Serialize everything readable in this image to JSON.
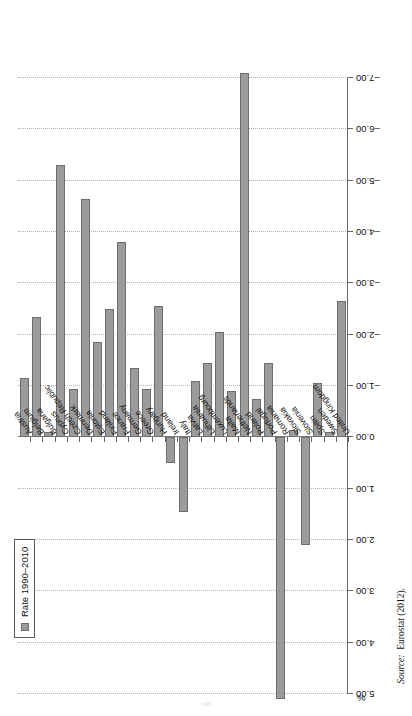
{
  "figure": {
    "axis_unit_label": "%",
    "source_prefix": "Source:",
    "source_text": "Eurostat (2012).",
    "page_number": "108"
  },
  "legend": {
    "entries": [
      {
        "label": "Rate 1990–2010",
        "color": "#9b9b9b"
      }
    ]
  },
  "colors": {
    "bar_fill": "#9b9b9b",
    "bar_stroke": "#6e6e6e",
    "grid": "#b5b5b5",
    "axis": "#666666"
  },
  "chart_data": {
    "type": "bar",
    "orientation": "vertical-rotated",
    "title": "",
    "xlabel": "",
    "ylabel": "%",
    "ylim": [
      5.0,
      -7.0
    ],
    "ytick_labels": [
      "5.00",
      "4.00",
      "3.00",
      "2.00",
      "1.00",
      "0.00",
      "-1.00",
      "-2.00",
      "-3.00",
      "-4.00",
      "-5.00",
      "-6.00",
      "-7.00"
    ],
    "ytick_values": [
      5,
      4,
      3,
      2,
      1,
      0,
      -1,
      -2,
      -3,
      -4,
      -5,
      -6,
      -7
    ],
    "grid": true,
    "legend_position": "top-left",
    "categories": [
      "Austria",
      "Belgium",
      "Bulgaria",
      "Cyprus",
      "Czech Republic",
      "Denmark",
      "Estonia",
      "Finland",
      "France",
      "Germany",
      "Greece",
      "Hungary",
      "Ireland",
      "Italy",
      "Latvia",
      "Lithuania",
      "Luxembourg",
      "Malta",
      "Netherlands",
      "Poland",
      "Portugal",
      "Romania",
      "Slovakia",
      "Slovenia",
      "Spain",
      "Sweden",
      "United Kingdom"
    ],
    "series": [
      {
        "name": "Rate 1990–2010",
        "values": [
          -1.15,
          -2.35,
          -0.1,
          -5.3,
          -0.95,
          -4.65,
          -1.85,
          -2.5,
          -3.8,
          -1.35,
          -0.95,
          -2.55,
          0.5,
          1.45,
          -1.1,
          -1.45,
          -2.05,
          -0.9,
          -7.1,
          -0.75,
          -1.45,
          5.1,
          -0.15,
          2.1,
          -1.05,
          -0.1,
          -2.65
        ]
      }
    ]
  }
}
